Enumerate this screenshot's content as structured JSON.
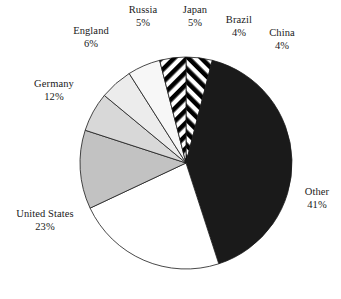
{
  "chart_data": {
    "type": "pie",
    "title": "",
    "subtitle": "",
    "xlabel": "",
    "ylabel": "",
    "legend_position": "callout-labels",
    "grid": false,
    "units": "percent",
    "start_angle_deg": 0,
    "direction": "clockwise",
    "categories": [
      "China",
      "Other",
      "United States",
      "Germany",
      "England",
      "Japan",
      "Russia",
      "Brazil"
    ],
    "values": [
      4,
      41,
      23,
      12,
      6,
      5,
      5,
      4
    ],
    "slices": [
      {
        "label": "China",
        "pct_text": "4%",
        "value": 4,
        "fill": "hatch-left",
        "color": "#000000"
      },
      {
        "label": "Other",
        "pct_text": "41%",
        "value": 41,
        "fill": "solid",
        "color": "#1a1a1a"
      },
      {
        "label": "United States",
        "pct_text": "23%",
        "value": 23,
        "fill": "solid",
        "color": "#ffffff"
      },
      {
        "label": "Germany",
        "pct_text": "12%",
        "value": 12,
        "fill": "solid",
        "color": "#c2c2c2"
      },
      {
        "label": "England",
        "pct_text": "6%",
        "value": 6,
        "fill": "solid",
        "color": "#d8d8d8"
      },
      {
        "label": "Japan",
        "pct_text": "5%",
        "value": 5,
        "fill": "solid",
        "color": "#ececec"
      },
      {
        "label": "Russia",
        "pct_text": "5%",
        "value": 5,
        "fill": "solid",
        "color": "#f7f7f7"
      },
      {
        "label": "Brazil",
        "pct_text": "4%",
        "value": 4,
        "fill": "hatch-right",
        "color": "#000000"
      }
    ]
  },
  "labels": {
    "russia": {
      "name": "Russia",
      "pct": "5%"
    },
    "japan": {
      "name": "Japan",
      "pct": "5%"
    },
    "brazil": {
      "name": "Brazil",
      "pct": "4%"
    },
    "china": {
      "name": "China",
      "pct": "4%"
    },
    "england": {
      "name": "England",
      "pct": "6%"
    },
    "germany": {
      "name": "Germany",
      "pct": "12%"
    },
    "united_states": {
      "name": "United States",
      "pct": "23%"
    },
    "other": {
      "name": "Other",
      "pct": "41%"
    }
  }
}
